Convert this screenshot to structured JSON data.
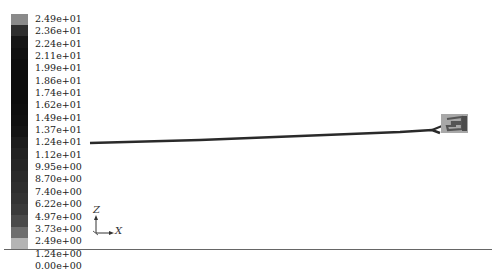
{
  "legend": {
    "labels": [
      "2.49e+01",
      "2.36e+01",
      "2.24e+01",
      "2.11e+01",
      "1.99e+01",
      "1.86e+01",
      "1.74e+01",
      "1.62e+01",
      "1.49e+01",
      "1.37e+01",
      "1.24e+01",
      "1.12e+01",
      "9.95e+00",
      "8.70e+00",
      "7.40e+00",
      "6.22e+00",
      "4.97e+00",
      "3.73e+00",
      "2.49e+00",
      "1.24e+00",
      "0.00e+00"
    ],
    "colors": [
      "#8a8a8a",
      "#2e2e2e",
      "#161616",
      "#111111",
      "#0e0e0e",
      "#0c0c0c",
      "#0c0c0c",
      "#0c0c0c",
      "#0e0e0e",
      "#101010",
      "#141414",
      "#1c1c1c",
      "#222222",
      "#262626",
      "#2a2a2a",
      "#2e2e2e",
      "#333333",
      "#3a3a3a",
      "#4a4a4a",
      "#6e6e6e",
      "#b4b4b4"
    ]
  },
  "axis_triad": {
    "vertical": "Z",
    "horizontal": "X"
  }
}
